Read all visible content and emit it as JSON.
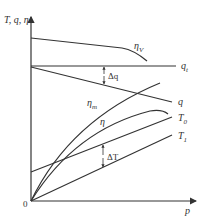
{
  "diagram": {
    "y_axis_label": "T, q, η",
    "x_axis_label": "p",
    "origin_label": "0",
    "curves": [
      {
        "id": "eta_V",
        "label_main": "η",
        "label_sub": "V"
      },
      {
        "id": "q_t",
        "label_main": "q",
        "label_sub": "t"
      },
      {
        "id": "q",
        "label_main": "q",
        "label_sub": ""
      },
      {
        "id": "eta_m",
        "label_main": "η",
        "label_sub": "m"
      },
      {
        "id": "eta",
        "label_main": "η",
        "label_sub": ""
      },
      {
        "id": "T0",
        "label_main": "T",
        "label_sub": "0"
      },
      {
        "id": "T1",
        "label_main": "T",
        "label_sub": "1"
      }
    ],
    "annotations": {
      "delta_q": "Δq",
      "delta_T": "ΔT"
    },
    "colors": {
      "line": "#333333",
      "background": "#ffffff"
    }
  }
}
